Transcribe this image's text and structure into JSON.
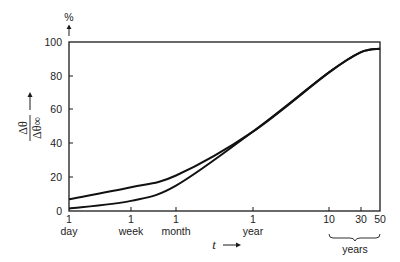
{
  "chart_data": {
    "type": "line",
    "title": "",
    "ylabel": "Δθ / Δθ∞",
    "ylabel_unit": "%",
    "xlabel": "t",
    "xscale": "log",
    "ylim": [
      0,
      100
    ],
    "yticks": [
      0,
      20,
      40,
      60,
      80,
      100
    ],
    "xticks": [
      {
        "label_top": "1",
        "label_bottom": "day"
      },
      {
        "label_top": "1",
        "label_bottom": "week"
      },
      {
        "label_top": "1",
        "label_bottom": "month"
      },
      {
        "label_top": "1",
        "label_bottom": "year"
      },
      {
        "label_top": "10",
        "label_bottom": ""
      },
      {
        "label_top": "30",
        "label_bottom": ""
      },
      {
        "label_top": "50",
        "label_bottom": ""
      }
    ],
    "x_group_label": "years",
    "grid": false,
    "legend": null,
    "x": [
      "1 day",
      "1 week",
      "1 month",
      "1 year",
      "10 years",
      "30 years",
      "50 years"
    ],
    "series": [
      {
        "name": "upper curve",
        "values": [
          7,
          14,
          21,
          47,
          82,
          94,
          96
        ]
      },
      {
        "name": "lower curve",
        "values": [
          1.5,
          6,
          15,
          47,
          82,
          94,
          96
        ]
      }
    ]
  },
  "labels": {
    "y_unit": "%",
    "y_arrow": "↑",
    "y_numerator": "Δθ",
    "y_denominator": "Δθ∞",
    "x_var": "t",
    "x_arrow": "→",
    "years_group": "years"
  }
}
